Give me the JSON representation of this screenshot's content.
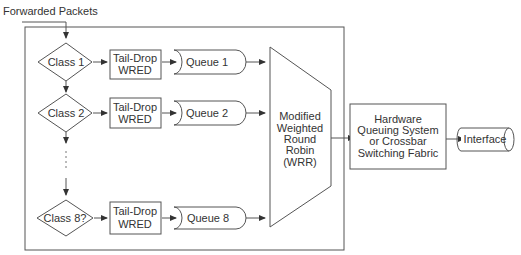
{
  "diagram": {
    "input_label": "Forwarded Packets",
    "classes": [
      {
        "label": "Class 1",
        "drop": [
          "Tail-Drop",
          "WRED"
        ],
        "queue": "Queue 1"
      },
      {
        "label": "Class 2",
        "drop": [
          "Tail-Drop",
          "WRED"
        ],
        "queue": "Queue 2"
      },
      {
        "label": "Class 8?",
        "drop": [
          "Tail-Drop",
          "WRED"
        ],
        "queue": "Queue 8"
      }
    ],
    "scheduler": [
      "Modified",
      "Weighted",
      "Round",
      "Robin",
      "(WRR)"
    ],
    "hardware": [
      "Hardware",
      "Queuing System",
      "or Crossbar",
      "Switching Fabric"
    ],
    "interface": "Interface"
  }
}
